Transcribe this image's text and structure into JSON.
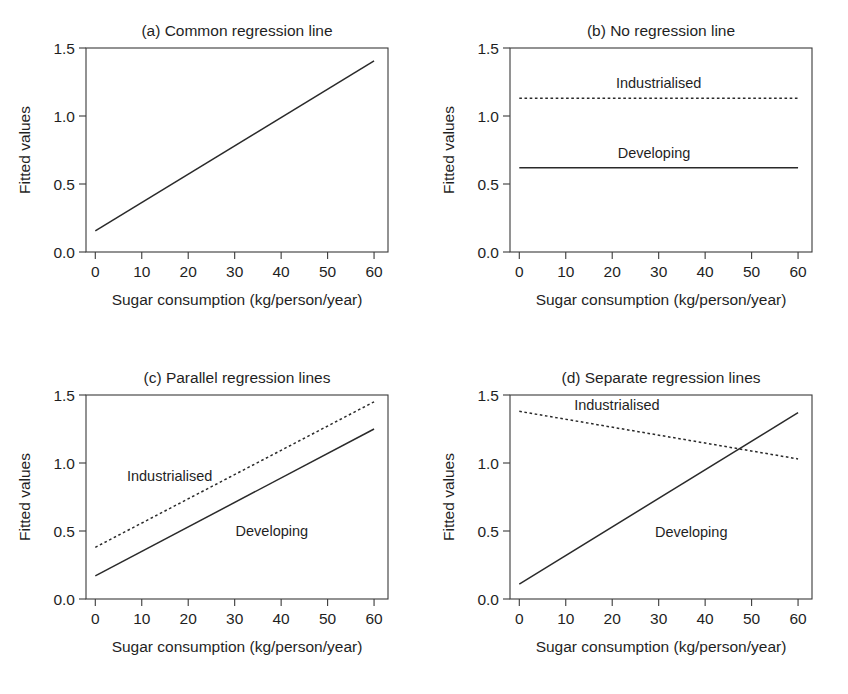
{
  "figure": {
    "width": 848,
    "height": 694,
    "background": "#ffffff",
    "ink_color": "#2a2a2a"
  },
  "common": {
    "xlabel": "Sugar consumption (kg/person/year)",
    "ylabel": "Fitted values",
    "xticks": [
      0,
      10,
      20,
      30,
      40,
      50,
      60
    ],
    "xtick_labels": [
      "0",
      "10",
      "20",
      "30",
      "40",
      "50",
      "60"
    ],
    "yticks": [
      0.0,
      0.5,
      1.0,
      1.5
    ],
    "ytick_labels": [
      "0.0",
      "0.5",
      "1.0",
      "1.5"
    ],
    "xlim": [
      -2,
      63
    ],
    "ylim": [
      0.0,
      1.5
    ],
    "grid": false,
    "legend_position": "inline-annotations"
  },
  "chart_data": [
    {
      "id": "panel-a",
      "type": "line",
      "title": "(a) Common regression line",
      "xlabel": "Sugar consumption (kg/person/year)",
      "ylabel": "Fitted values",
      "xlim": [
        -2,
        63
      ],
      "ylim": [
        0.0,
        1.5
      ],
      "grid": false,
      "series": [
        {
          "name": "Common",
          "style": "solid",
          "label": "",
          "label_x": null,
          "label_y": null,
          "x": [
            0,
            60
          ],
          "y": [
            0.155,
            1.405
          ]
        }
      ]
    },
    {
      "id": "panel-b",
      "type": "line",
      "title": "(b) No regression line",
      "xlabel": "Sugar consumption (kg/person/year)",
      "ylabel": "Fitted values",
      "xlim": [
        -2,
        63
      ],
      "ylim": [
        0.0,
        1.5
      ],
      "grid": false,
      "series": [
        {
          "name": "Industrialised",
          "style": "dotted",
          "label": "Industrialised",
          "label_x": 30,
          "label_y": 1.245,
          "x": [
            0,
            60
          ],
          "y": [
            1.13,
            1.13
          ]
        },
        {
          "name": "Developing",
          "style": "solid",
          "label": "Developing",
          "label_x": 29,
          "label_y": 0.73,
          "x": [
            0,
            60
          ],
          "y": [
            0.62,
            0.62
          ]
        }
      ]
    },
    {
      "id": "panel-c",
      "type": "line",
      "title": "(c) Parallel regression lines",
      "xlabel": "Sugar consumption (kg/person/year)",
      "ylabel": "Fitted values",
      "xlim": [
        -2,
        63
      ],
      "ylim": [
        0.0,
        1.5
      ],
      "grid": false,
      "series": [
        {
          "name": "Industrialised",
          "style": "dotted",
          "label": "Industrialised",
          "label_x": 16,
          "label_y": 0.905,
          "x": [
            0,
            60
          ],
          "y": [
            0.38,
            1.45
          ]
        },
        {
          "name": "Developing",
          "style": "solid",
          "label": "Developing",
          "label_x": 38,
          "label_y": 0.5,
          "x": [
            0,
            60
          ],
          "y": [
            0.17,
            1.25
          ]
        }
      ]
    },
    {
      "id": "panel-d",
      "type": "line",
      "title": "(d) Separate regression lines",
      "xlabel": "Sugar consumption (kg/person/year)",
      "ylabel": "Fitted values",
      "xlim": [
        -2,
        63
      ],
      "ylim": [
        0.0,
        1.5
      ],
      "grid": false,
      "series": [
        {
          "name": "Industrialised",
          "style": "dotted",
          "label": "Industrialised",
          "label_x": 21,
          "label_y": 1.425,
          "x": [
            0,
            60
          ],
          "y": [
            1.38,
            1.03
          ]
        },
        {
          "name": "Developing",
          "style": "solid",
          "label": "Developing",
          "label_x": 37,
          "label_y": 0.49,
          "x": [
            0,
            60
          ],
          "y": [
            0.11,
            1.37
          ]
        }
      ]
    }
  ]
}
